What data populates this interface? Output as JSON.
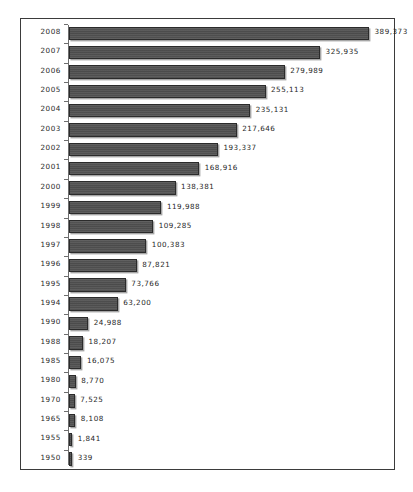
{
  "chart_data": {
    "type": "bar",
    "orientation": "horizontal",
    "title": "",
    "subtitle": "",
    "xlabel": "",
    "ylabel": "",
    "grid": false,
    "legend": null,
    "axis_ranges": {
      "value_min": 0,
      "value_max": 389373
    },
    "categories": [
      "2008",
      "2007",
      "2006",
      "2005",
      "2004",
      "2003",
      "2002",
      "2001",
      "2000",
      "1999",
      "1998",
      "1997",
      "1996",
      "1995",
      "1994",
      "1990",
      "1988",
      "1985",
      "1980",
      "1970",
      "1965",
      "1955",
      "1950"
    ],
    "values": [
      389373,
      325935,
      279989,
      255113,
      235131,
      217646,
      193337,
      168916,
      138381,
      119988,
      109285,
      100383,
      87821,
      73766,
      63200,
      24988,
      18207,
      16075,
      8770,
      7525,
      8108,
      1841,
      339
    ],
    "value_labels": [
      "389,373",
      "325,935",
      "279,989",
      "255,113",
      "235,131",
      "217,646",
      "193,337",
      "168,916",
      "138,381",
      "119,988",
      "109,285",
      "100,383",
      "87,821",
      "73,766",
      "63,200",
      "24,988",
      "18,207",
      "16,075",
      "8,770",
      "7,525",
      "8,108",
      "1,841",
      "339"
    ],
    "colors": {
      "bar_fill": "#525252",
      "bar_border": "#2b2b2b",
      "bar_shadow": "#969696",
      "axis": "#6e6e6e",
      "frame_border": "#3b3b3b",
      "background": "#ffffff",
      "text": "#1f1f1f"
    }
  }
}
